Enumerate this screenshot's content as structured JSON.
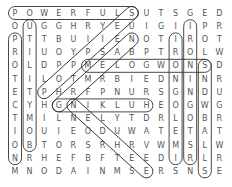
{
  "puzzle": {
    "type": "word-search",
    "rows": [
      "POWERFULSUTSGED",
      "OUGGHRYEUIGIIPR",
      "PTTBUIIENOTIROT",
      "RIUOYPSABPTROLW",
      "OLDPPMELOGWONSD",
      "TILOTMRBIEDNINR",
      "ETPHRFPNURSGNDU",
      "CYHGNIKLUHEOGWG",
      "TMILNELYTDRLOBR",
      "IOUIEODUWATETAT",
      "OBTORSRHRVWMSLW",
      "NRHEFBFTEEDIRLR",
      "MNODAINMSERSNSE"
    ],
    "found_words": [
      {
        "word": "POWERFULS",
        "from": [
          0,
          0
        ],
        "to": [
          0,
          8
        ]
      },
      {
        "word": "PROTECTION",
        "from": [
          2,
          0
        ],
        "to": [
          11,
          0
        ]
      },
      {
        "word": "UTILITYMOB",
        "from": [
          1,
          1
        ],
        "to": [
          10,
          1
        ]
      },
      {
        "word": "MELOGWONS",
        "from": [
          4,
          5
        ],
        "to": [
          4,
          13
        ]
      },
      {
        "word": "GNIKLUH",
        "from": [
          7,
          3
        ],
        "to": [
          7,
          9
        ]
      },
      {
        "word": "IRONINGOTS",
        "from": [
          2,
          11
        ],
        "to": [
          11,
          11
        ]
      },
      {
        "word": "IIONINGOTSR",
        "from": [
          1,
          12
        ],
        "to": [
          11,
          12
        ]
      },
      {
        "word": "SNDWBALLS",
        "from": [
          4,
          13
        ],
        "to": [
          12,
          13
        ]
      },
      {
        "word": "NELDRHSE",
        "from": [
          7,
          4
        ],
        "to": [
          12,
          9
        ]
      },
      {
        "word": "diagonal-1",
        "from": [
          0,
          8
        ],
        "to": [
          6,
          2
        ]
      },
      {
        "word": "diagonal-2",
        "from": [
          2,
          8
        ],
        "to": [
          7,
          3
        ]
      }
    ],
    "colors": {
      "letter": "#555555",
      "outline": "#333333",
      "background": "#ffffff"
    }
  }
}
